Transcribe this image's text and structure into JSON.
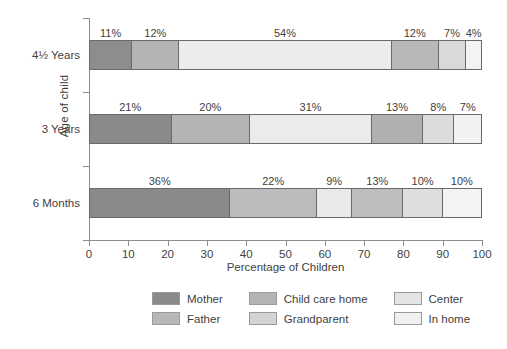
{
  "chart_data": {
    "type": "bar",
    "orientation": "horizontal",
    "stacked": true,
    "stack_mode": "percent",
    "title": "",
    "xlabel": "Percentage of Children",
    "ylabel": "Age of child",
    "xlim": [
      0,
      100
    ],
    "xticks": [
      0,
      10,
      20,
      30,
      40,
      50,
      60,
      70,
      80,
      90,
      100
    ],
    "xtick_labels": [
      "0",
      "10",
      "20",
      "30",
      "40",
      "50",
      "60",
      "70",
      "80",
      "90",
      "100"
    ],
    "grid": false,
    "legend_position": "bottom",
    "categories": [
      "4½ Years",
      "3 Years",
      "6 Months"
    ],
    "series": [
      {
        "name": "Mother",
        "color": "#8a8a8a",
        "values": [
          11,
          21,
          36
        ],
        "labels": [
          "11%",
          "21%",
          "36%"
        ]
      },
      {
        "name": "Father",
        "color": "#b2b2b2",
        "values": [
          12,
          20,
          22
        ],
        "labels": [
          "12%",
          "20%",
          "22%"
        ]
      },
      {
        "name": "Child care home",
        "color": "#a8a8a8",
        "values": [
          0,
          0,
          0
        ],
        "labels": [
          "",
          "",
          ""
        ]
      },
      {
        "name": "Grandparent",
        "color": "#d6d6d6",
        "values": [
          54,
          31,
          9
        ],
        "labels": [
          "54%",
          "31%",
          "9%"
        ]
      },
      {
        "name": "Center",
        "color": "#ededed",
        "values": [
          12,
          13,
          13
        ],
        "labels": [
          "12%",
          "13%",
          "13%"
        ]
      },
      {
        "name": "In home",
        "color": "#f4f4f4",
        "values": [
          7,
          8,
          10
        ],
        "labels": [
          "7%",
          "8%",
          "10%"
        ]
      }
    ],
    "bars": [
      {
        "category": "4½ Years",
        "segments": [
          {
            "series": "Mother",
            "value": 11,
            "label": "11%",
            "color": "#8d8d8d"
          },
          {
            "series": "Father",
            "value": 12,
            "label": "12%",
            "color": "#b4b4b4"
          },
          {
            "series": "Child care home",
            "value": 54,
            "label": "54%",
            "color": "#ececec"
          },
          {
            "series": "Grandparent",
            "value": 12,
            "label": "12%",
            "color": "#b8b8b8"
          },
          {
            "series": "Center",
            "value": 7,
            "label": "7%",
            "color": "#d9d9d9"
          },
          {
            "series": "In home",
            "value": 4,
            "label": "4%",
            "color": "#f3f3f3"
          }
        ]
      },
      {
        "category": "3 Years",
        "segments": [
          {
            "series": "Mother",
            "value": 21,
            "label": "21%",
            "color": "#8a8a8a"
          },
          {
            "series": "Father",
            "value": 20,
            "label": "20%",
            "color": "#b4b4b4"
          },
          {
            "series": "Child care home",
            "value": 31,
            "label": "31%",
            "color": "#ebebeb"
          },
          {
            "series": "Grandparent",
            "value": 13,
            "label": "13%",
            "color": "#b0b0b0"
          },
          {
            "series": "Center",
            "value": 8,
            "label": "8%",
            "color": "#dcdcdc"
          },
          {
            "series": "In home",
            "value": 7,
            "label": "7%",
            "color": "#f2f2f2"
          }
        ]
      },
      {
        "category": "6 Months",
        "segments": [
          {
            "series": "Mother",
            "value": 36,
            "label": "36%",
            "color": "#8a8a8a"
          },
          {
            "series": "Father",
            "value": 22,
            "label": "22%",
            "color": "#bcbcbc"
          },
          {
            "series": "Child care home",
            "value": 9,
            "label": "9%",
            "color": "#e9e9e9"
          },
          {
            "series": "Grandparent",
            "value": 13,
            "label": "13%",
            "color": "#bdbdbd"
          },
          {
            "series": "Center",
            "value": 10,
            "label": "10%",
            "color": "#dedede"
          },
          {
            "series": "In home",
            "value": 10,
            "label": "10%",
            "color": "#f3f3f3"
          }
        ]
      }
    ],
    "legend": [
      {
        "label": "Mother",
        "color": "#8a8a8a"
      },
      {
        "label": "Child care home",
        "color": "#b4b4b4"
      },
      {
        "label": "Center",
        "color": "#e4e4e4"
      },
      {
        "label": "Father",
        "color": "#b8b8b8"
      },
      {
        "label": "Grandparent",
        "color": "#d4d4d4"
      },
      {
        "label": "In home",
        "color": "#f1f1f1"
      }
    ]
  }
}
